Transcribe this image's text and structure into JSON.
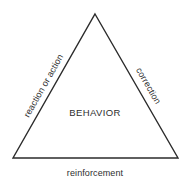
{
  "diagram": {
    "type": "triangle-diagram",
    "title_text": "BEHAVIOR",
    "center_label": "BEHAVIOR",
    "left_edge_label": "reaction or action",
    "right_edge_label": "correction",
    "bottom_edge_label": "reinforcement",
    "colors": {
      "background": "#ffffff",
      "stroke": "#2b2b2b",
      "text": "#2e2e2e"
    },
    "geometry": {
      "apex": [
        95,
        14
      ],
      "base_left": [
        13,
        158
      ],
      "base_right": [
        178,
        158
      ],
      "stroke_width": 1.4
    }
  }
}
